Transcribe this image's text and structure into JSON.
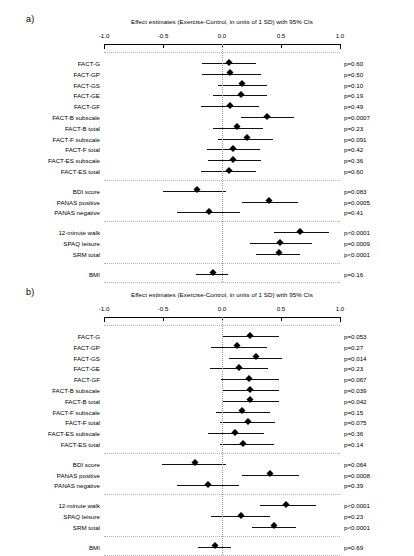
{
  "figure": {
    "axis": {
      "ticks": [
        -1.0,
        -0.5,
        0.0,
        0.5,
        1.0
      ],
      "tick_labels": [
        "-1.0",
        "-0.5",
        "0.0",
        "0.5",
        "1.0"
      ],
      "xmin": -1.0,
      "xmax": 1.0,
      "reference_line": 0.0
    },
    "marker_color": "#000000",
    "reference_line_color": "#9a9a9a",
    "separator_color": "#b4b4b4"
  },
  "chart_data": [
    {
      "type": "scatter",
      "panel": "a)",
      "title": "Effect estimates (Exercise-Control, in units of 1 SD) with 95% CIs",
      "xlabel": "",
      "ylabel": "",
      "xlim": [
        -1.0,
        1.0
      ],
      "xticks": [
        -1.0,
        -0.5,
        0.0,
        0.5,
        1.0
      ],
      "xticklabels": [
        "-1.0",
        "-0.5",
        "0.0",
        "0.5",
        "1.0"
      ],
      "grid": false,
      "legend": "none",
      "reference_line": 0.0,
      "groups": [
        {
          "name": "FACT scales",
          "rows": [
            {
              "label": "FACT-G",
              "estimate": 0.06,
              "ci_low": -0.17,
              "ci_high": 0.29,
              "p": "p=0.60"
            },
            {
              "label": "FACT-GP",
              "estimate": 0.07,
              "ci_low": -0.17,
              "ci_high": 0.33,
              "p": "p=0.50"
            },
            {
              "label": "FACT-GS",
              "estimate": 0.17,
              "ci_low": -0.03,
              "ci_high": 0.38,
              "p": "p=0.10"
            },
            {
              "label": "FACT-GE",
              "estimate": 0.16,
              "ci_low": -0.08,
              "ci_high": 0.38,
              "p": "p=0.19"
            },
            {
              "label": "FACT-GF",
              "estimate": 0.07,
              "ci_low": -0.18,
              "ci_high": 0.31,
              "p": "p=0.49"
            },
            {
              "label": "FACT-B subscale",
              "estimate": 0.38,
              "ci_low": 0.16,
              "ci_high": 0.61,
              "p": "p=0.0007"
            },
            {
              "label": "FACT-B total",
              "estimate": 0.13,
              "ci_low": -0.08,
              "ci_high": 0.35,
              "p": "p=0.23"
            },
            {
              "label": "FACT-F subscale",
              "estimate": 0.21,
              "ci_low": -0.03,
              "ci_high": 0.43,
              "p": "p=0.091"
            },
            {
              "label": "FACT-F total",
              "estimate": 0.09,
              "ci_low": -0.13,
              "ci_high": 0.32,
              "p": "p=0.42"
            },
            {
              "label": "FACT-ES subscale",
              "estimate": 0.09,
              "ci_low": -0.12,
              "ci_high": 0.33,
              "p": "p=0.36"
            },
            {
              "label": "FACT-ES total",
              "estimate": 0.06,
              "ci_low": -0.18,
              "ci_high": 0.29,
              "p": "p=0.60"
            }
          ]
        },
        {
          "name": "Mood",
          "rows": [
            {
              "label": "BDI score",
              "estimate": -0.21,
              "ci_low": -0.5,
              "ci_high": 0.03,
              "p": "p=0.083"
            },
            {
              "label": "PANAS positive",
              "estimate": 0.4,
              "ci_low": 0.17,
              "ci_high": 0.64,
              "p": "p=0.0005"
            },
            {
              "label": "PANAS negative",
              "estimate": -0.11,
              "ci_low": -0.38,
              "ci_high": 0.15,
              "p": "p=0.41"
            }
          ]
        },
        {
          "name": "Fitness and activity",
          "rows": [
            {
              "label": "12-minute walk",
              "estimate": 0.66,
              "ci_low": 0.44,
              "ci_high": 0.91,
              "p": "p<0.0001"
            },
            {
              "label": "SPAQ leisure",
              "estimate": 0.49,
              "ci_low": 0.24,
              "ci_high": 0.76,
              "p": "p=0.0009"
            },
            {
              "label": "SRM total",
              "estimate": 0.48,
              "ci_low": 0.29,
              "ci_high": 0.66,
              "p": "p<0.0001"
            }
          ]
        },
        {
          "name": "Body composition",
          "rows": [
            {
              "label": "BMI",
              "estimate": -0.08,
              "ci_low": -0.22,
              "ci_high": 0.05,
              "p": "p=0.16"
            }
          ]
        }
      ]
    },
    {
      "type": "scatter",
      "panel": "b)",
      "title": "Effect estimates (Exercise-Control, in units of 1 SD) with 95% CIs",
      "xlabel": "",
      "ylabel": "",
      "xlim": [
        -1.0,
        1.0
      ],
      "xticks": [
        -1.0,
        -0.5,
        0.0,
        0.5,
        1.0
      ],
      "xticklabels": [
        "-1.0",
        "-0.5",
        "0.0",
        "0.5",
        "1.0"
      ],
      "grid": false,
      "legend": "none",
      "reference_line": 0.0,
      "groups": [
        {
          "name": "FACT scales",
          "rows": [
            {
              "label": "FACT-G",
              "estimate": 0.24,
              "ci_low": 0.0,
              "ci_high": 0.48,
              "p": "p=0.053"
            },
            {
              "label": "FACT-GP",
              "estimate": 0.13,
              "ci_low": -0.09,
              "ci_high": 0.38,
              "p": "p=0.27"
            },
            {
              "label": "FACT-GS",
              "estimate": 0.29,
              "ci_low": 0.06,
              "ci_high": 0.51,
              "p": "p=0.014"
            },
            {
              "label": "FACT-GE",
              "estimate": 0.14,
              "ci_low": -0.1,
              "ci_high": 0.39,
              "p": "p=0.23"
            },
            {
              "label": "FACT-GF",
              "estimate": 0.23,
              "ci_low": -0.01,
              "ci_high": 0.48,
              "p": "p=0.067"
            },
            {
              "label": "FACT-B subscale",
              "estimate": 0.24,
              "ci_low": 0.01,
              "ci_high": 0.48,
              "p": "p=0.039"
            },
            {
              "label": "FACT-B total",
              "estimate": 0.24,
              "ci_low": 0.01,
              "ci_high": 0.48,
              "p": "p=0.042"
            },
            {
              "label": "FACT-F subscale",
              "estimate": 0.17,
              "ci_low": -0.05,
              "ci_high": 0.41,
              "p": "p=0.15"
            },
            {
              "label": "FACT-F total",
              "estimate": 0.22,
              "ci_low": -0.02,
              "ci_high": 0.45,
              "p": "p=0.075"
            },
            {
              "label": "FACT-ES subscale",
              "estimate": 0.11,
              "ci_low": -0.12,
              "ci_high": 0.36,
              "p": "p=0.36"
            },
            {
              "label": "FACT-ES total",
              "estimate": 0.18,
              "ci_low": -0.02,
              "ci_high": 0.44,
              "p": "p=0.14"
            }
          ]
        },
        {
          "name": "Mood",
          "rows": [
            {
              "label": "BDI score",
              "estimate": -0.23,
              "ci_low": -0.51,
              "ci_high": 0.03,
              "p": "p=0.064"
            },
            {
              "label": "PANAS positive",
              "estimate": 0.41,
              "ci_low": 0.17,
              "ci_high": 0.65,
              "p": "p=0.0008"
            },
            {
              "label": "PANAS negative",
              "estimate": -0.12,
              "ci_low": -0.38,
              "ci_high": 0.14,
              "p": "p=0.39"
            }
          ]
        },
        {
          "name": "Fitness and activity",
          "rows": [
            {
              "label": "12-minute walk",
              "estimate": 0.54,
              "ci_low": 0.32,
              "ci_high": 0.8,
              "p": "p<0.0001"
            },
            {
              "label": "SPAQ leisure",
              "estimate": 0.16,
              "ci_low": -0.09,
              "ci_high": 0.41,
              "p": "p=0.23"
            },
            {
              "label": "SRM total",
              "estimate": 0.44,
              "ci_low": 0.25,
              "ci_high": 0.63,
              "p": "p<0.0001"
            }
          ]
        },
        {
          "name": "Body composition",
          "rows": [
            {
              "label": "BMI",
              "estimate": -0.06,
              "ci_low": -0.2,
              "ci_high": 0.08,
              "p": "p=0.69"
            }
          ]
        }
      ]
    }
  ]
}
